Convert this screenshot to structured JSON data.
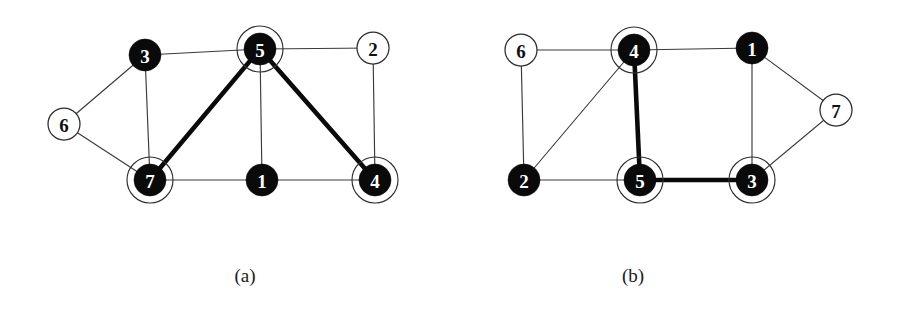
{
  "figure": {
    "width": 899,
    "height": 322,
    "background_color": "#ffffff",
    "ink_color": "#0a0a0a",
    "thin_edge_color": "#3a3a3a",
    "thick_edge_color": "#0a0a0a",
    "halo_color": "#2e2e2e"
  },
  "panels": [
    {
      "id": "panel-a",
      "caption": "(a)",
      "caption_x": 245,
      "caption_y": 276,
      "nodes": [
        {
          "id": "a3",
          "label": "3",
          "x": 145,
          "y": 55,
          "r": 16,
          "style": "filled",
          "halo": false,
          "halo_r": 0
        },
        {
          "id": "a5",
          "label": "5",
          "x": 260,
          "y": 49,
          "r": 16,
          "style": "filled",
          "halo": true,
          "halo_r": 23
        },
        {
          "id": "a2",
          "label": "2",
          "x": 373,
          "y": 48,
          "r": 16,
          "style": "open",
          "halo": false,
          "halo_r": 0
        },
        {
          "id": "a6",
          "label": "6",
          "x": 64,
          "y": 124,
          "r": 16,
          "style": "open",
          "halo": false,
          "halo_r": 0
        },
        {
          "id": "a7",
          "label": "7",
          "x": 150,
          "y": 180,
          "r": 16,
          "style": "filled",
          "halo": true,
          "halo_r": 23
        },
        {
          "id": "a1",
          "label": "1",
          "x": 262,
          "y": 180,
          "r": 16,
          "style": "filled",
          "halo": false,
          "halo_r": 0
        },
        {
          "id": "a4",
          "label": "4",
          "x": 375,
          "y": 180,
          "r": 16,
          "style": "filled",
          "halo": true,
          "halo_r": 23
        }
      ],
      "edges": [
        {
          "id": "a-3-5",
          "from": "a3",
          "to": "a5",
          "weight": "thin"
        },
        {
          "id": "a-5-2",
          "from": "a5",
          "to": "a2",
          "weight": "thin"
        },
        {
          "id": "a-3-7",
          "from": "a3",
          "to": "a7",
          "weight": "thin"
        },
        {
          "id": "a-5-1",
          "from": "a5",
          "to": "a1",
          "weight": "thin"
        },
        {
          "id": "a-2-4",
          "from": "a2",
          "to": "a4",
          "weight": "thin"
        },
        {
          "id": "a-7-1",
          "from": "a7",
          "to": "a1",
          "weight": "thin"
        },
        {
          "id": "a-1-4",
          "from": "a1",
          "to": "a4",
          "weight": "thin"
        },
        {
          "id": "a-6-3",
          "from": "a6",
          "to": "a3",
          "weight": "thin"
        },
        {
          "id": "a-6-7",
          "from": "a6",
          "to": "a7",
          "weight": "thin"
        },
        {
          "id": "a-5-7",
          "from": "a5",
          "to": "a7",
          "weight": "thick"
        },
        {
          "id": "a-5-4",
          "from": "a5",
          "to": "a4",
          "weight": "thick"
        }
      ]
    },
    {
      "id": "panel-b",
      "caption": "(b)",
      "caption_x": 633,
      "caption_y": 276,
      "nodes": [
        {
          "id": "b6",
          "label": "6",
          "x": 521,
          "y": 50,
          "r": 16,
          "style": "open",
          "halo": false,
          "halo_r": 0
        },
        {
          "id": "b4",
          "label": "4",
          "x": 634,
          "y": 50,
          "r": 16,
          "style": "filled",
          "halo": true,
          "halo_r": 23
        },
        {
          "id": "b1",
          "label": "1",
          "x": 752,
          "y": 48,
          "r": 16,
          "style": "filled",
          "halo": false,
          "halo_r": 0
        },
        {
          "id": "b7",
          "label": "7",
          "x": 836,
          "y": 110,
          "r": 16,
          "style": "open",
          "halo": false,
          "halo_r": 0
        },
        {
          "id": "b2",
          "label": "2",
          "x": 524,
          "y": 180,
          "r": 16,
          "style": "filled",
          "halo": false,
          "halo_r": 0
        },
        {
          "id": "b5",
          "label": "5",
          "x": 640,
          "y": 180,
          "r": 16,
          "style": "filled",
          "halo": true,
          "halo_r": 23
        },
        {
          "id": "b3",
          "label": "3",
          "x": 752,
          "y": 180,
          "r": 16,
          "style": "filled",
          "halo": true,
          "halo_r": 23
        }
      ],
      "edges": [
        {
          "id": "b-6-4",
          "from": "b6",
          "to": "b4",
          "weight": "thin"
        },
        {
          "id": "b-6-2",
          "from": "b6",
          "to": "b2",
          "weight": "thin"
        },
        {
          "id": "b-4-1",
          "from": "b4",
          "to": "b1",
          "weight": "thin"
        },
        {
          "id": "b-4-2",
          "from": "b4",
          "to": "b2",
          "weight": "thin"
        },
        {
          "id": "b-1-7",
          "from": "b1",
          "to": "b7",
          "weight": "thin"
        },
        {
          "id": "b-1-3",
          "from": "b1",
          "to": "b3",
          "weight": "thin"
        },
        {
          "id": "b-3-7",
          "from": "b3",
          "to": "b7",
          "weight": "thin"
        },
        {
          "id": "b-2-5",
          "from": "b2",
          "to": "b5",
          "weight": "thin"
        },
        {
          "id": "b-4-5",
          "from": "b4",
          "to": "b5",
          "weight": "thick"
        },
        {
          "id": "b-5-3",
          "from": "b5",
          "to": "b3",
          "weight": "thick"
        }
      ]
    }
  ]
}
